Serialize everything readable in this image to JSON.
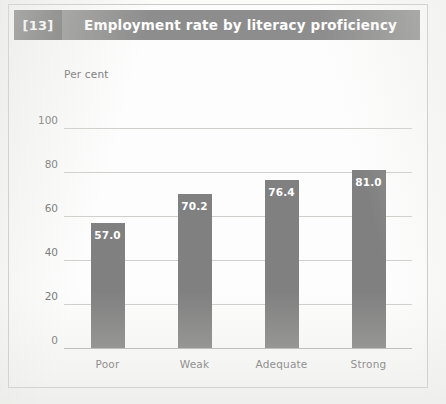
{
  "figure": {
    "number_label": "[13]",
    "title": "Employment rate by literacy proficiency"
  },
  "colors": {
    "header_band": "#8d8d8d",
    "number_block": "#6f6f6f",
    "bar": "#808080",
    "gridline": "#cfcfcc",
    "axis_text": "#6e6e6e",
    "value_text": "#ffffff"
  },
  "chart_data": {
    "type": "bar",
    "title": "Employment rate by literacy proficiency",
    "xlabel": "",
    "ylabel": "Per cent",
    "categories": [
      "Poor",
      "Weak",
      "Adequate",
      "Strong"
    ],
    "values": [
      57.0,
      70.2,
      76.4,
      81.0
    ],
    "value_labels": [
      "57.0",
      "70.2",
      "76.4",
      "81.0"
    ],
    "ylim": [
      0,
      100
    ],
    "yticks": [
      0,
      20,
      40,
      60,
      80,
      100
    ],
    "ytick_labels": [
      "0",
      "20",
      "40",
      "60",
      "80",
      "100"
    ],
    "grid": true,
    "legend": "none"
  }
}
